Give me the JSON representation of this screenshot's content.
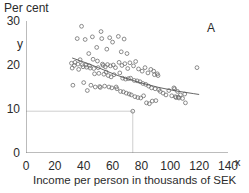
{
  "chart_data": {
    "type": "scatter",
    "title": "",
    "panel_label": "A",
    "ylabel": "Per cent",
    "xlabel": "Income per person in thousands of SEK",
    "y_axis_symbol": "y",
    "x_axis_symbol": "x",
    "xlim": [
      0,
      140
    ],
    "ylim": [
      0,
      30
    ],
    "xticks": [
      0,
      20,
      40,
      60,
      80,
      100,
      120,
      140
    ],
    "yticks": [
      0,
      10,
      20,
      30
    ],
    "grid": false,
    "legend": null,
    "marker": "open-circle",
    "marker_color": "#6e6e6e",
    "trend_color": "#555555",
    "reference_line_color": "#c8c8c8",
    "reference_lines": {
      "horizontal_y": 9.5,
      "vertical_x": 74.0,
      "intersection": [
        74.0,
        9.5
      ]
    },
    "trend_line": {
      "name": "smoothed trend",
      "x": [
        32,
        38,
        44,
        50,
        56,
        62,
        68,
        74,
        80,
        86,
        92,
        98,
        104,
        110,
        116,
        120
      ],
      "y": [
        21.6,
        20.9,
        20.2,
        19.4,
        18.6,
        17.8,
        17.1,
        16.5,
        15.9,
        15.4,
        14.9,
        14.5,
        14.1,
        13.8,
        13.5,
        13.3
      ]
    },
    "points": [
      [
        31.5,
        20.4
      ],
      [
        32.0,
        19.3
      ],
      [
        32.5,
        15.4
      ],
      [
        33.5,
        19.9
      ],
      [
        34.0,
        20.6
      ],
      [
        35.5,
        26.0
      ],
      [
        36.0,
        20.2
      ],
      [
        36.5,
        19.0
      ],
      [
        37.5,
        21.2
      ],
      [
        38.5,
        28.8
      ],
      [
        39.0,
        20.1
      ],
      [
        39.5,
        19.6
      ],
      [
        40.0,
        16.0
      ],
      [
        41.0,
        25.8
      ],
      [
        41.5,
        20.0
      ],
      [
        42.0,
        19.5
      ],
      [
        42.5,
        14.2
      ],
      [
        43.5,
        22.6
      ],
      [
        44.0,
        19.8
      ],
      [
        44.5,
        19.3
      ],
      [
        45.0,
        15.4
      ],
      [
        46.0,
        26.4
      ],
      [
        46.5,
        21.3
      ],
      [
        47.0,
        19.2
      ],
      [
        47.5,
        18.0
      ],
      [
        48.0,
        15.0
      ],
      [
        49.0,
        24.0
      ],
      [
        49.5,
        20.9
      ],
      [
        50.0,
        19.4
      ],
      [
        50.5,
        18.1
      ],
      [
        51.0,
        15.1
      ],
      [
        51.5,
        14.9
      ],
      [
        52.0,
        27.6
      ],
      [
        52.5,
        26.0
      ],
      [
        53.0,
        20.2
      ],
      [
        53.5,
        19.9
      ],
      [
        54.0,
        17.9
      ],
      [
        54.5,
        15.2
      ],
      [
        55.0,
        19.6
      ],
      [
        55.5,
        18.4
      ],
      [
        56.0,
        23.6
      ],
      [
        56.5,
        20.1
      ],
      [
        57.0,
        17.6
      ],
      [
        57.5,
        15.0
      ],
      [
        58.0,
        26.2
      ],
      [
        58.5,
        19.8
      ],
      [
        59.0,
        17.3
      ],
      [
        59.5,
        14.8
      ],
      [
        60.0,
        25.2
      ],
      [
        60.5,
        20.0
      ],
      [
        61.0,
        17.8
      ],
      [
        62.0,
        19.4
      ],
      [
        62.5,
        15.0
      ],
      [
        63.0,
        14.6
      ],
      [
        64.0,
        26.5
      ],
      [
        64.5,
        20.6
      ],
      [
        65.0,
        18.2
      ],
      [
        65.5,
        14.0
      ],
      [
        66.0,
        23.0
      ],
      [
        66.5,
        19.9
      ],
      [
        67.0,
        17.0
      ],
      [
        67.5,
        13.9
      ],
      [
        68.0,
        25.9
      ],
      [
        68.5,
        20.3
      ],
      [
        69.0,
        16.8
      ],
      [
        69.5,
        13.6
      ],
      [
        70.0,
        22.6
      ],
      [
        70.5,
        19.2
      ],
      [
        71.0,
        16.9
      ],
      [
        71.5,
        13.4
      ],
      [
        72.0,
        20.5
      ],
      [
        72.5,
        17.0
      ],
      [
        73.0,
        13.2
      ],
      [
        74.0,
        9.5
      ],
      [
        74.5,
        19.8
      ],
      [
        75.0,
        16.5
      ],
      [
        75.5,
        12.8
      ],
      [
        76.0,
        20.8
      ],
      [
        77.0,
        16.4
      ],
      [
        77.5,
        12.6
      ],
      [
        78.0,
        19.1
      ],
      [
        79.0,
        16.2
      ],
      [
        79.5,
        12.5
      ],
      [
        80.5,
        18.6
      ],
      [
        81.0,
        15.8
      ],
      [
        81.5,
        13.0
      ],
      [
        82.5,
        19.4
      ],
      [
        83.0,
        15.6
      ],
      [
        83.5,
        11.4
      ],
      [
        84.5,
        18.2
      ],
      [
        85.0,
        15.2
      ],
      [
        85.5,
        11.2
      ],
      [
        86.5,
        19.0
      ],
      [
        87.0,
        14.8
      ],
      [
        87.5,
        11.8
      ],
      [
        88.5,
        18.6
      ],
      [
        89.0,
        17.8
      ],
      [
        89.5,
        14.6
      ],
      [
        90.0,
        11.9
      ],
      [
        91.0,
        18.0
      ],
      [
        91.5,
        17.6
      ],
      [
        92.0,
        14.4
      ],
      [
        93.0,
        14.0
      ],
      [
        95.0,
        13.6
      ],
      [
        97.0,
        13.2
      ],
      [
        99.0,
        14.2
      ],
      [
        101.0,
        13.0
      ],
      [
        102.5,
        14.8
      ],
      [
        103.0,
        14.6
      ],
      [
        103.5,
        12.8
      ],
      [
        104.0,
        12.6
      ],
      [
        105.0,
        14.0
      ],
      [
        105.5,
        12.7
      ],
      [
        106.0,
        12.5
      ],
      [
        107.0,
        13.2
      ],
      [
        108.5,
        12.4
      ],
      [
        110.0,
        13.4
      ],
      [
        110.5,
        11.4
      ],
      [
        118.5,
        19.4
      ]
    ]
  }
}
